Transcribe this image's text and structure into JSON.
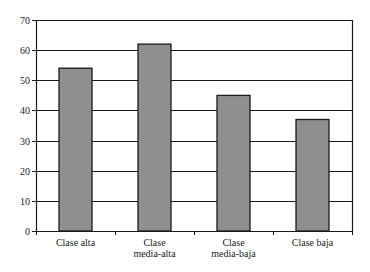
{
  "chart_data": {
    "type": "bar",
    "title": "",
    "xlabel": "",
    "ylabel": "",
    "categories": [
      [
        "Clase alta"
      ],
      [
        "Clase",
        "media-alta"
      ],
      [
        "Clase",
        "media-baja"
      ],
      [
        "Clase baja"
      ]
    ],
    "category_names": [
      "Clase alta",
      "Clase media-alta",
      "Clase media-baja",
      "Clase baja"
    ],
    "values": [
      54,
      62,
      45,
      37
    ],
    "ylim": [
      0,
      70
    ],
    "yticks": [
      0,
      10,
      20,
      30,
      40,
      50,
      60,
      70
    ],
    "grid": true,
    "legend": null,
    "colors": {
      "bar": "#8f8f8f",
      "bar_edge": "#1a1a1a",
      "grid": "#1a1a1a",
      "axis": "#1a1a1a"
    }
  }
}
